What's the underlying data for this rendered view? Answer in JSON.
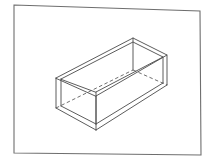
{
  "figure": {
    "canvas": {
      "width": 214,
      "height": 165,
      "background": "#ffffff"
    },
    "ink_color": "#4a4a4a",
    "frame_color": "#6e6e6e",
    "frame_stroke_width": 1.1,
    "solid_stroke_width": 0.9,
    "hidden_stroke_width": 0.8,
    "hidden_dash_pattern": "3.5 2.5",
    "border_frame": {
      "label": "drawing-border",
      "points": "14,5 200,11 201,155 14,153"
    },
    "object": {
      "name": "open-box",
      "description": "Rectangular tray with no lid, drawn with visible solid edges and hidden edges as dashed lines",
      "vertices": {
        "rim_left": [
          56,
          78
        ],
        "rim_back": [
          133,
          38
        ],
        "rim_right": [
          167,
          55
        ],
        "rim_front": [
          96,
          96
        ],
        "base_left": [
          56,
          108
        ],
        "base_front": [
          96,
          130
        ],
        "base_right": [
          167,
          85
        ],
        "base_back_hidden": [
          133,
          70
        ],
        "inner_rim_left": [
          61,
          79
        ],
        "inner_rim_back": [
          133,
          42
        ],
        "inner_rim_right": [
          163,
          57
        ],
        "inner_rim_front": [
          96,
          92
        ],
        "floor_left": [
          61,
          106
        ],
        "floor_front": [
          96,
          124
        ],
        "floor_right": [
          163,
          83
        ]
      },
      "solid_paths": [
        {
          "id": "outer-rim-top",
          "d": "M 56 78 L 133 38 L 167 55 L 96 96 Z"
        },
        {
          "id": "inner-rim-top",
          "d": "M 61 79 L 133 42 L 163 57 L 96 92 Z"
        },
        {
          "id": "left-vertical",
          "d": "M 56 78 L 56 108"
        },
        {
          "id": "left-vertical-inner",
          "d": "M 61 79 L 61 106"
        },
        {
          "id": "front-vertical",
          "d": "M 96 96 L 96 130"
        },
        {
          "id": "front-vertical-inner",
          "d": "M 96 92 L 96 124"
        },
        {
          "id": "right-vertical",
          "d": "M 167 55 L 167 85"
        },
        {
          "id": "right-vertical-inner",
          "d": "M 163 57 L 163 83"
        },
        {
          "id": "base-front-left",
          "d": "M 56 108 L 96 130"
        },
        {
          "id": "base-front-right",
          "d": "M 96 130 L 167 85"
        },
        {
          "id": "floor-front-left",
          "d": "M 61 106 L 96 124"
        },
        {
          "id": "floor-front-right",
          "d": "M 96 124 L 163 83"
        },
        {
          "id": "back-vertical",
          "d": "M 133 38 L 133 70"
        }
      ],
      "hidden_paths": [
        {
          "id": "hidden-base-back-left",
          "d": "M 56 108 L 133 70"
        },
        {
          "id": "hidden-base-back-right",
          "d": "M 133 70 L 167 85"
        }
      ]
    }
  }
}
